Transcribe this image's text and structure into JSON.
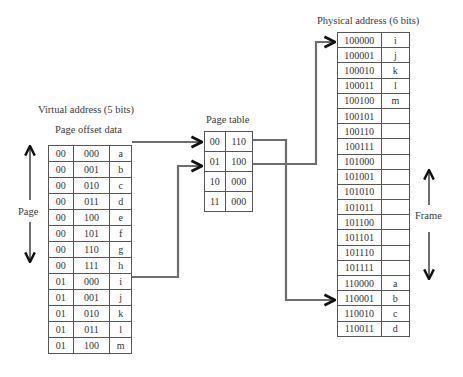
{
  "virtual": {
    "title": "Virtual address (5 bits)",
    "subtitle": "Page offset data",
    "page_label": "Page",
    "rows": [
      [
        "00",
        "000",
        "a"
      ],
      [
        "00",
        "001",
        "b"
      ],
      [
        "00",
        "010",
        "c"
      ],
      [
        "00",
        "011",
        "d"
      ],
      [
        "00",
        "100",
        "e"
      ],
      [
        "00",
        "101",
        "f"
      ],
      [
        "00",
        "110",
        "g"
      ],
      [
        "00",
        "111",
        "h"
      ],
      [
        "01",
        "000",
        "i"
      ],
      [
        "01",
        "001",
        "j"
      ],
      [
        "01",
        "010",
        "k"
      ],
      [
        "01",
        "011",
        "l"
      ],
      [
        "01",
        "100",
        "m"
      ]
    ]
  },
  "page_table": {
    "title": "Page table",
    "rows": [
      [
        "00",
        "110"
      ],
      [
        "01",
        "100"
      ],
      [
        "10",
        "000"
      ],
      [
        "11",
        "000"
      ]
    ]
  },
  "physical": {
    "title": "Physical address (6 bits)",
    "frame_label": "Frame",
    "rows": [
      [
        "100000",
        "i"
      ],
      [
        "100001",
        "j"
      ],
      [
        "100010",
        "k"
      ],
      [
        "100011",
        "l"
      ],
      [
        "100100",
        "m"
      ],
      [
        "100101",
        ""
      ],
      [
        "100110",
        ""
      ],
      [
        "100111",
        ""
      ],
      [
        "101000",
        ""
      ],
      [
        "101001",
        ""
      ],
      [
        "101010",
        ""
      ],
      [
        "101011",
        ""
      ],
      [
        "101100",
        ""
      ],
      [
        "101101",
        ""
      ],
      [
        "101110",
        ""
      ],
      [
        "101111",
        ""
      ],
      [
        "110000",
        "a"
      ],
      [
        "110001",
        "b"
      ],
      [
        "110010",
        "c"
      ],
      [
        "110011",
        "d"
      ]
    ]
  },
  "colors": {
    "line": "#6e6e6e",
    "arrowhead": "#111111",
    "border": "#555555"
  }
}
